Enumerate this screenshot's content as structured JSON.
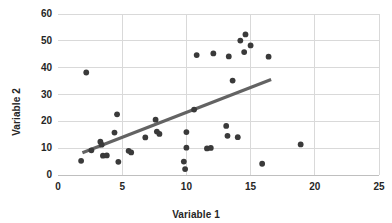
{
  "chart_data": {
    "type": "scatter",
    "title": "",
    "xlabel": "Variable 1",
    "ylabel": "Variable 2",
    "xlim": [
      0,
      25
    ],
    "ylim": [
      0,
      60
    ],
    "xticks": [
      0,
      5,
      10,
      15,
      20,
      25
    ],
    "yticks": [
      0,
      10,
      20,
      30,
      40,
      50,
      60
    ],
    "grid": true,
    "grid_axis": "both",
    "legend": false,
    "marker_color": "#3a3a3a",
    "gridline_color": "#d9d9d9",
    "trendline_color": "#636363",
    "points": [
      {
        "x": 1.8,
        "y": 5.3
      },
      {
        "x": 2.2,
        "y": 38.2
      },
      {
        "x": 2.6,
        "y": 9.2
      },
      {
        "x": 3.3,
        "y": 12.4
      },
      {
        "x": 3.4,
        "y": 11.3
      },
      {
        "x": 3.5,
        "y": 7.2
      },
      {
        "x": 3.8,
        "y": 7.3
      },
      {
        "x": 4.4,
        "y": 15.8
      },
      {
        "x": 4.6,
        "y": 22.6
      },
      {
        "x": 4.7,
        "y": 4.9
      },
      {
        "x": 5.5,
        "y": 9.0
      },
      {
        "x": 5.7,
        "y": 8.4
      },
      {
        "x": 6.8,
        "y": 14.0
      },
      {
        "x": 7.6,
        "y": 20.6
      },
      {
        "x": 7.7,
        "y": 16.2
      },
      {
        "x": 7.9,
        "y": 15.3
      },
      {
        "x": 9.8,
        "y": 5.0
      },
      {
        "x": 9.9,
        "y": 2.2
      },
      {
        "x": 10.0,
        "y": 10.2
      },
      {
        "x": 10.0,
        "y": 16.0
      },
      {
        "x": 10.6,
        "y": 24.4
      },
      {
        "x": 10.8,
        "y": 44.7
      },
      {
        "x": 11.6,
        "y": 9.9
      },
      {
        "x": 11.9,
        "y": 10.1
      },
      {
        "x": 12.1,
        "y": 45.3
      },
      {
        "x": 13.1,
        "y": 18.3
      },
      {
        "x": 13.2,
        "y": 14.6
      },
      {
        "x": 13.3,
        "y": 44.2
      },
      {
        "x": 13.6,
        "y": 35.2
      },
      {
        "x": 14.0,
        "y": 14.1
      },
      {
        "x": 14.2,
        "y": 50.1
      },
      {
        "x": 14.5,
        "y": 45.8
      },
      {
        "x": 14.6,
        "y": 52.4
      },
      {
        "x": 15.0,
        "y": 48.3
      },
      {
        "x": 15.9,
        "y": 4.2
      },
      {
        "x": 16.4,
        "y": 44.1
      },
      {
        "x": 18.9,
        "y": 11.4
      }
    ],
    "trendline": {
      "x_start": 1.9,
      "y_start": 8.3,
      "x_end": 16.6,
      "y_end": 35.6
    }
  }
}
